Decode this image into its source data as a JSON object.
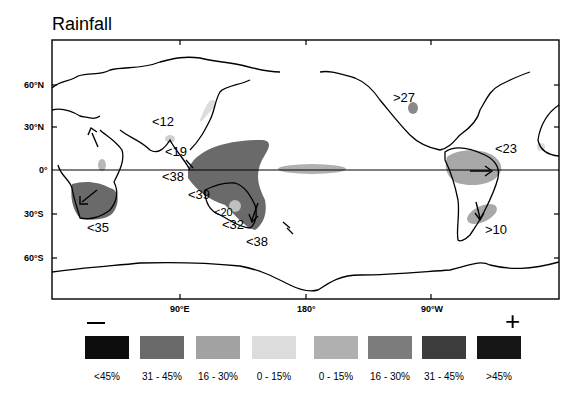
{
  "title": "Rainfall",
  "axes": {
    "lat_labels": [
      {
        "label": "60°N",
        "y": 85
      },
      {
        "label": "30°N",
        "y": 127
      },
      {
        "label": "0°",
        "y": 170
      },
      {
        "label": "30°S",
        "y": 214
      },
      {
        "label": "60°S",
        "y": 258
      }
    ],
    "lon_labels": [
      {
        "label": "90°E",
        "x": 180
      },
      {
        "label": "180°",
        "x": 306
      },
      {
        "label": "90°W",
        "x": 431
      }
    ]
  },
  "annotations": [
    {
      "text": "<12",
      "x": 152,
      "y": 114
    },
    {
      "text": "<19",
      "x": 165,
      "y": 144
    },
    {
      "text": "<38",
      "x": 162,
      "y": 169
    },
    {
      "text": "<39",
      "x": 188,
      "y": 187
    },
    {
      "text": "<20",
      "x": 214,
      "y": 206
    },
    {
      "text": "<32",
      "x": 222,
      "y": 217
    },
    {
      "text": "<38",
      "x": 246,
      "y": 234
    },
    {
      "text": "<35",
      "x": 87,
      "y": 220
    },
    {
      "text": ">27",
      "x": 393,
      "y": 90
    },
    {
      "text": "<23",
      "x": 495,
      "y": 141
    },
    {
      "text": ">10",
      "x": 485,
      "y": 222
    }
  ],
  "legend": {
    "minus_sign": "—",
    "plus_sign": "+",
    "items": [
      {
        "label": "<45%",
        "color": "#0d0d0d"
      },
      {
        "label": "31 - 45%",
        "color": "#6a6a6a"
      },
      {
        "label": "16 - 30%",
        "color": "#a2a2a2"
      },
      {
        "label": "0 - 15%",
        "color": "#dcdcdc"
      },
      {
        "label": "0 - 15%",
        "color": "#b0b0b0"
      },
      {
        "label": "16 - 30%",
        "color": "#7c7c7c"
      },
      {
        "label": "31 - 45%",
        "color": "#3c3c3c"
      },
      {
        "label": ">45%",
        "color": "#161616"
      }
    ]
  },
  "colors": {
    "frame": "#000000",
    "neg_dark": "#6a6a6a",
    "neg_light": "#dcdcdc",
    "pos_mid": "#9c9c9c",
    "pos_dark": "#7c7c7c"
  }
}
